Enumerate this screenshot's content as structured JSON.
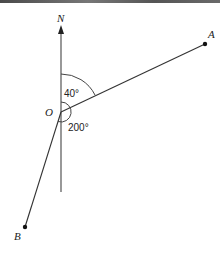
{
  "diagram": {
    "type": "bearing-diagram",
    "labels": {
      "north": "N",
      "origin": "O",
      "point_a": "A",
      "point_b": "B",
      "angle_a": "40°",
      "angle_b": "200°"
    },
    "bearings": {
      "A": 40,
      "B": 200
    },
    "colors": {
      "line": "#333333",
      "topbar": "#5a5a5a"
    }
  }
}
